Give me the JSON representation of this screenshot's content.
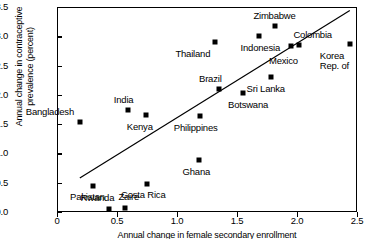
{
  "chart_data": {
    "type": "scatter",
    "title": "",
    "xlabel": "Annual change in female secondary enrollment",
    "ylabel": "Annual change in contraceptive prevalence (percent)",
    "xlim": [
      0,
      2.5
    ],
    "ylim": [
      0,
      3.5
    ],
    "xticks": [
      "0",
      "0.5",
      "1.0",
      "1.5",
      "2.0",
      "2.5"
    ],
    "xtick_values": [
      0,
      0.5,
      1.0,
      1.5,
      2.0,
      2.5
    ],
    "yticks": [
      "0.0",
      "0.5",
      "1.0",
      "1.5",
      "2.0",
      "2.5",
      "3.0",
      "3.5"
    ],
    "ytick_values": [
      0.0,
      0.5,
      1.0,
      1.5,
      2.0,
      2.5,
      3.0,
      3.5
    ],
    "grid": false,
    "legend": "none",
    "trendline": {
      "x1": 0.19,
      "y1": 0.58,
      "x2": 2.44,
      "y2": 3.44
    },
    "points": [
      {
        "label": "Bangladesh",
        "x": 0.19,
        "y": 1.54,
        "lx": -54,
        "ly": -15
      },
      {
        "label": "Pakistan",
        "x": 0.3,
        "y": 0.45,
        "lx": -23,
        "ly": 6
      },
      {
        "label": "Rwanda",
        "x": 0.43,
        "y": 0.05,
        "lx": -28,
        "ly": -16
      },
      {
        "label": "Zaire",
        "x": 0.57,
        "y": 0.07,
        "lx": -7,
        "ly": -16
      },
      {
        "label": "India",
        "x": 0.59,
        "y": 1.74,
        "lx": -14,
        "ly": -15
      },
      {
        "label": "Kenya",
        "x": 0.74,
        "y": 1.65,
        "lx": -19,
        "ly": 7
      },
      {
        "label": "Costa Rica",
        "x": 0.75,
        "y": 0.48,
        "lx": -26,
        "ly": 6
      },
      {
        "label": "Ghana",
        "x": 1.18,
        "y": 0.88,
        "lx": -16,
        "ly": 7
      },
      {
        "label": "Philippines",
        "x": 1.19,
        "y": 1.64,
        "lx": -26,
        "ly": 7
      },
      {
        "label": "Thailand",
        "x": 1.32,
        "y": 2.91,
        "lx": -40,
        "ly": 7
      },
      {
        "label": "Brazil",
        "x": 1.35,
        "y": 2.1,
        "lx": -20,
        "ly": -15
      },
      {
        "label": "Botswana",
        "x": 1.55,
        "y": 2.04,
        "lx": -15,
        "ly": 7
      },
      {
        "label": "Indonesia",
        "x": 1.68,
        "y": 3.01,
        "lx": -18,
        "ly": 7
      },
      {
        "label": "Sri Lanka",
        "x": 1.78,
        "y": 2.31,
        "lx": -24,
        "ly": 7
      },
      {
        "label": "Zimbabwe",
        "x": 1.82,
        "y": 3.17,
        "lx": -22,
        "ly": -15
      },
      {
        "label": "Mexico",
        "x": 1.95,
        "y": 2.83,
        "lx": -22,
        "ly": 10
      },
      {
        "label": "Colombia",
        "x": 2.02,
        "y": 2.85,
        "lx": -6,
        "ly": -15
      },
      {
        "label": "Korea\nRep. of",
        "x": 2.44,
        "y": 2.87,
        "lx": -30,
        "ly": 7
      }
    ]
  }
}
